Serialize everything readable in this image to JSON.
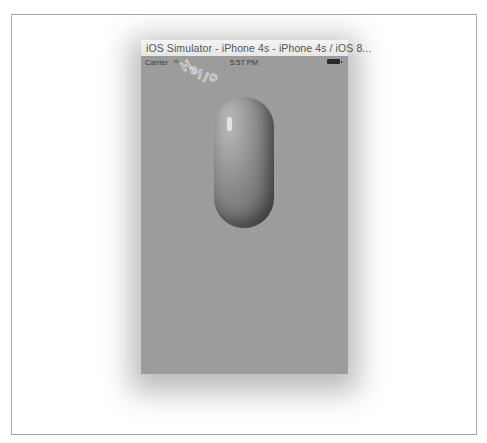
{
  "window": {
    "title": "iOS Simulator - iPhone 4s - iPhone 4s / iOS 8..."
  },
  "status_bar": {
    "carrier": "Carrier",
    "wifi_icon": "wifi-icon",
    "time": "5:57 PM",
    "battery_icon": "battery-icon"
  },
  "screen": {
    "background_color": "#9c9c9c",
    "curved_text_letters": [
      "H",
      "e",
      "l",
      "l",
      "o"
    ],
    "pill_shape": "capsule-view"
  }
}
